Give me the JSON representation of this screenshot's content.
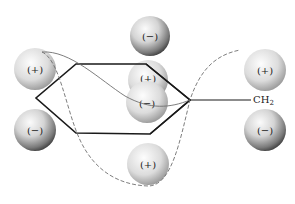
{
  "diagram": {
    "type": "cation-pi orbital interaction diagram",
    "substituent_label": "CH",
    "substituent_subscript": "2",
    "colors": {
      "background": "#ffffff",
      "bond_line": "#1a1a1a",
      "orbital_curve": "#777777",
      "sphere_light": "#f2f2f2",
      "sphere_dark": "#2a2a2a"
    },
    "spheres": [
      {
        "id": "top-center",
        "charge": "(−)",
        "cx": 150,
        "cy": 36,
        "r": 20
      },
      {
        "id": "left-upper",
        "charge": "(+)",
        "cx": 35,
        "cy": 69,
        "r": 21
      },
      {
        "id": "left-lower",
        "charge": "(−)",
        "cx": 35,
        "cy": 130,
        "r": 21
      },
      {
        "id": "center-back",
        "charge": "(+)",
        "cx": 148,
        "cy": 80,
        "r": 20
      },
      {
        "id": "center-front",
        "charge": "(−)",
        "cx": 147,
        "cy": 102,
        "r": 21
      },
      {
        "id": "right-upper",
        "charge": "(+)",
        "cx": 265,
        "cy": 70,
        "r": 21
      },
      {
        "id": "right-lower",
        "charge": "(−)",
        "cx": 265,
        "cy": 130,
        "r": 21
      },
      {
        "id": "bottom-center",
        "charge": "(+)",
        "cx": 148,
        "cy": 164,
        "r": 21
      }
    ],
    "hexagon_points": "76,64 146,64 190,100 150,134 76,133 36,98",
    "substituent_bond": {
      "x1": 190,
      "y1": 100,
      "x2": 251,
      "y2": 100
    }
  }
}
